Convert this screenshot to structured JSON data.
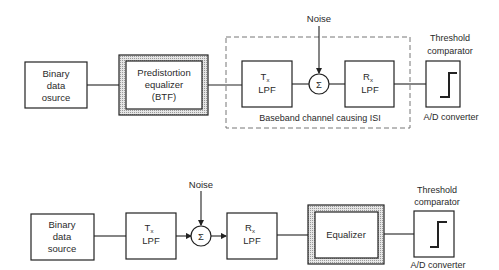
{
  "diagram_top": {
    "source": {
      "lines": [
        "Binary",
        "data",
        "osurce"
      ]
    },
    "predistortion": {
      "lines": [
        "Predistortion",
        "equalizer",
        "(BTF)"
      ]
    },
    "tx": {
      "main": "T",
      "sub": "x",
      "line2": "LPF"
    },
    "noise": "Noise",
    "sum": "Σ",
    "rx": {
      "main": "R",
      "sub": "x",
      "line2": "LPF"
    },
    "channel_label": "Baseband channel causing ISI",
    "comparator": {
      "title1": "Threshold",
      "title2": "comparator",
      "caption": "A/D converter"
    }
  },
  "diagram_bottom": {
    "source": {
      "lines": [
        "Binary",
        "data",
        "source"
      ]
    },
    "tx": {
      "main": "T",
      "sub": "x",
      "line2": "LPF"
    },
    "noise": "Noise",
    "sum": "Σ",
    "rx": {
      "main": "R",
      "sub": "x",
      "line2": "LPF"
    },
    "equalizer": "Equalizer",
    "comparator": {
      "title1": "Threshold",
      "title2": "comparator",
      "caption": "A/D converter"
    }
  }
}
